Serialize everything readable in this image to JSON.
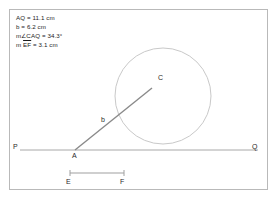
{
  "canvas": {
    "background_color": "#ffffff",
    "frame_color": "#b9b9b9"
  },
  "measurements": [
    {
      "text": "AQ = 11.1 cm"
    },
    {
      "text": "b = 6.2 cm"
    },
    {
      "text": "m∠CAQ = 34.3°"
    },
    {
      "text": "m EF = 3.1 cm"
    }
  ],
  "measurement_parts": {
    "aq_label": "AQ = 11.1 cm",
    "b_label": "b = 6.2 cm",
    "angle_label": "m∠CAQ = 34.3°",
    "ef_prefix": "m ",
    "ef_segment": "EF",
    "ef_suffix": " = 3.1 cm"
  },
  "points": {
    "P": {
      "label": "P",
      "x": 20,
      "y": 150
    },
    "A": {
      "label": "A",
      "x": 75,
      "y": 150
    },
    "Q": {
      "label": "Q",
      "x": 258,
      "y": 150
    },
    "C": {
      "label": "C",
      "x": 155,
      "y": 85
    },
    "E": {
      "label": "E",
      "x": 70,
      "y": 174
    },
    "F": {
      "label": "F",
      "x": 124,
      "y": 174
    }
  },
  "labels": {
    "b": "b"
  },
  "shapes": {
    "line_PQ": {
      "name": "line-pq",
      "x1": 20,
      "y1": 150,
      "x2": 258,
      "y2": 150,
      "color": "#a8a8a8"
    },
    "ray_AC": {
      "name": "ray-ac",
      "x1": 75,
      "y1": 150,
      "x2": 152,
      "y2": 88,
      "color": "#8a8a8a"
    },
    "circle_C": {
      "name": "circle-c",
      "cx": 163,
      "cy": 96,
      "r": 48,
      "color": "#c9c9c9"
    },
    "segment_EF": {
      "name": "segment-ef",
      "x1": 70,
      "y1": 173,
      "x2": 124,
      "y2": 173,
      "color": "#a0a0a0"
    }
  },
  "colors": {
    "line": "#a8a8a8",
    "ray": "#8a8a8a",
    "circle": "#c9c9c9",
    "segment": "#a0a0a0",
    "text": "#1b1b1b"
  }
}
